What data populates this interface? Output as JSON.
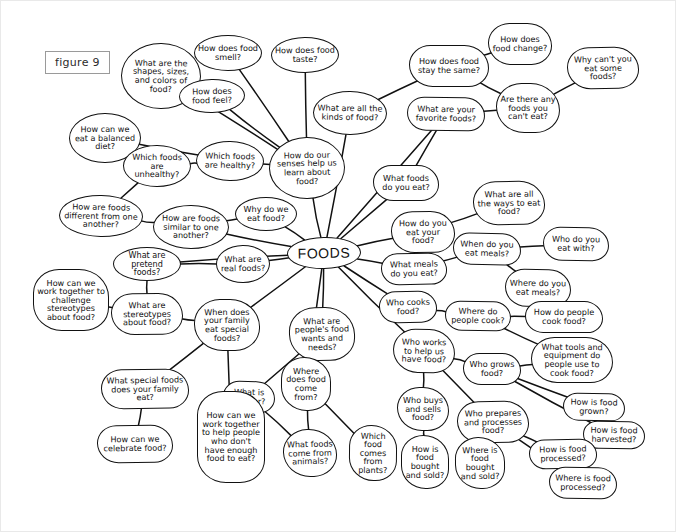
{
  "figure": {
    "label": "figure 9"
  },
  "diagram": {
    "center": {
      "id": "foods",
      "label": "FOODS",
      "x": 286,
      "y": 236,
      "w": 74,
      "h": 32
    },
    "ink_color": "#111111",
    "background_color": "#ffffff",
    "nodes": [
      {
        "id": "shapes_sizes_colors",
        "label": "What are the shapes, sizes, and colors of food?",
        "x": 120,
        "y": 42,
        "w": 80,
        "h": 66,
        "shape": "round"
      },
      {
        "id": "food_smell",
        "label": "How does food smell?",
        "x": 193,
        "y": 34,
        "w": 68,
        "h": 36,
        "shape": "round"
      },
      {
        "id": "food_taste",
        "label": "How does food taste?",
        "x": 270,
        "y": 36,
        "w": 68,
        "h": 36,
        "shape": "round"
      },
      {
        "id": "food_feel",
        "label": "How does food feel?",
        "x": 178,
        "y": 78,
        "w": 66,
        "h": 34,
        "shape": "round"
      },
      {
        "id": "kinds_of_food",
        "label": "What are all the kinds of food?",
        "x": 312,
        "y": 90,
        "w": 74,
        "h": 44,
        "shape": "round"
      },
      {
        "id": "food_stay_same",
        "label": "How does food stay the same?",
        "x": 408,
        "y": 44,
        "w": 80,
        "h": 42,
        "shape": "soft"
      },
      {
        "id": "food_change",
        "label": "How does food change?",
        "x": 487,
        "y": 22,
        "w": 64,
        "h": 42,
        "shape": "soft"
      },
      {
        "id": "why_cant_eat",
        "label": "Why can't you eat some foods?",
        "x": 566,
        "y": 46,
        "w": 72,
        "h": 42,
        "shape": "soft"
      },
      {
        "id": "favorite_foods",
        "label": "What are your favorite foods?",
        "x": 406,
        "y": 96,
        "w": 78,
        "h": 34,
        "shape": "soft"
      },
      {
        "id": "foods_cant_eat",
        "label": "Are there any foods you can't eat?",
        "x": 495,
        "y": 82,
        "w": 64,
        "h": 50,
        "shape": "soft"
      },
      {
        "id": "balanced_diet",
        "label": "How can we eat a balanced diet?",
        "x": 68,
        "y": 112,
        "w": 72,
        "h": 50,
        "shape": "round"
      },
      {
        "id": "senses_learn",
        "label": "How do our senses help us learn about food?",
        "x": 268,
        "y": 136,
        "w": 76,
        "h": 62,
        "shape": "round"
      },
      {
        "id": "which_healthy",
        "label": "Which foods are healthy?",
        "x": 195,
        "y": 140,
        "w": 68,
        "h": 40,
        "shape": "round"
      },
      {
        "id": "foods_unhealthy",
        "label": "Which foods are unhealthy?",
        "x": 122,
        "y": 144,
        "w": 68,
        "h": 42,
        "shape": "round"
      },
      {
        "id": "foods_you_eat",
        "label": "What foods do you eat?",
        "x": 372,
        "y": 164,
        "w": 66,
        "h": 36,
        "shape": "soft"
      },
      {
        "id": "ways_to_eat",
        "label": "What are all the ways to eat food?",
        "x": 472,
        "y": 180,
        "w": 72,
        "h": 44,
        "shape": "soft"
      },
      {
        "id": "foods_different",
        "label": "How are foods different from one another?",
        "x": 58,
        "y": 194,
        "w": 84,
        "h": 42,
        "shape": "round"
      },
      {
        "id": "foods_similar",
        "label": "How are foods similar to one another?",
        "x": 152,
        "y": 204,
        "w": 76,
        "h": 44,
        "shape": "round"
      },
      {
        "id": "why_eat_food",
        "label": "Why do we eat food?",
        "x": 234,
        "y": 196,
        "w": 62,
        "h": 34,
        "shape": "round"
      },
      {
        "id": "how_eat_food",
        "label": "How do you eat your food?",
        "x": 390,
        "y": 210,
        "w": 64,
        "h": 42,
        "shape": "soft"
      },
      {
        "id": "when_eat_meals",
        "label": "When do you eat meals?",
        "x": 452,
        "y": 232,
        "w": 68,
        "h": 32,
        "shape": "soft"
      },
      {
        "id": "who_eat_with",
        "label": "Who do you eat with?",
        "x": 542,
        "y": 226,
        "w": 66,
        "h": 34,
        "shape": "soft"
      },
      {
        "id": "pretend_foods",
        "label": "What are pretend foods?",
        "x": 112,
        "y": 246,
        "w": 68,
        "h": 34,
        "shape": "round"
      },
      {
        "id": "real_foods",
        "label": "What are real foods?",
        "x": 215,
        "y": 244,
        "w": 54,
        "h": 38,
        "shape": "round"
      },
      {
        "id": "what_meals",
        "label": "What meals do you eat?",
        "x": 380,
        "y": 252,
        "w": 66,
        "h": 32,
        "shape": "soft"
      },
      {
        "id": "where_eat_meals",
        "label": "Where do you eat meals?",
        "x": 504,
        "y": 268,
        "w": 66,
        "h": 38,
        "shape": "soft"
      },
      {
        "id": "challenge_stereo",
        "label": "How can we work together to challenge stereotypes about food?",
        "x": 32,
        "y": 268,
        "w": 76,
        "h": 62,
        "shape": "soft"
      },
      {
        "id": "stereotypes",
        "label": "What are stereotypes about food?",
        "x": 110,
        "y": 292,
        "w": 72,
        "h": 42,
        "shape": "soft"
      },
      {
        "id": "who_cooks",
        "label": "Who cooks food?",
        "x": 378,
        "y": 290,
        "w": 58,
        "h": 32,
        "shape": "soft"
      },
      {
        "id": "where_cook",
        "label": "Where do people cook?",
        "x": 444,
        "y": 300,
        "w": 66,
        "h": 30,
        "shape": "soft"
      },
      {
        "id": "how_people_cook",
        "label": "How do people cook food?",
        "x": 524,
        "y": 300,
        "w": 78,
        "h": 32,
        "shape": "soft"
      },
      {
        "id": "family_special",
        "label": "When does your family eat special foods?",
        "x": 193,
        "y": 298,
        "w": 66,
        "h": 52,
        "shape": "soft"
      },
      {
        "id": "peoples_wants",
        "label": "What are people's food wants and needs?",
        "x": 288,
        "y": 306,
        "w": 66,
        "h": 54,
        "shape": "soft"
      },
      {
        "id": "who_helps",
        "label": "Who works to help us have food?",
        "x": 392,
        "y": 328,
        "w": 62,
        "h": 44,
        "shape": "soft"
      },
      {
        "id": "tools_equipment",
        "label": "What tools and equipment do people use to cook food?",
        "x": 530,
        "y": 336,
        "w": 82,
        "h": 46,
        "shape": "soft"
      },
      {
        "id": "who_grows",
        "label": "Who grows food?",
        "x": 462,
        "y": 352,
        "w": 58,
        "h": 32,
        "shape": "soft"
      },
      {
        "id": "special_family",
        "label": "What special foods does your family eat?",
        "x": 100,
        "y": 368,
        "w": 88,
        "h": 40,
        "shape": "soft"
      },
      {
        "id": "what_is_hunger",
        "label": "What is hunger?",
        "x": 222,
        "y": 380,
        "w": 52,
        "h": 32,
        "shape": "soft"
      },
      {
        "id": "where_food_from",
        "label": "Where does food come from?",
        "x": 280,
        "y": 356,
        "w": 50,
        "h": 54,
        "shape": "soft"
      },
      {
        "id": "who_buys_sells",
        "label": "Who buys and sells food?",
        "x": 396,
        "y": 386,
        "w": 52,
        "h": 44,
        "shape": "soft"
      },
      {
        "id": "who_prepares",
        "label": "Who prepares and processes food?",
        "x": 456,
        "y": 400,
        "w": 72,
        "h": 42,
        "shape": "soft"
      },
      {
        "id": "how_grown",
        "label": "How is food grown?",
        "x": 562,
        "y": 392,
        "w": 62,
        "h": 28,
        "shape": "soft"
      },
      {
        "id": "how_harvested",
        "label": "How is food harvested?",
        "x": 582,
        "y": 420,
        "w": 62,
        "h": 28,
        "shape": "soft"
      },
      {
        "id": "help_people",
        "label": "How can we work together to help people who don't have enough food to eat?",
        "x": 196,
        "y": 390,
        "w": 68,
        "h": 92,
        "shape": "soft"
      },
      {
        "id": "celebrate",
        "label": "How can we celebrate food?",
        "x": 96,
        "y": 424,
        "w": 76,
        "h": 38,
        "shape": "soft"
      },
      {
        "id": "from_animals",
        "label": "What foods come from animals?",
        "x": 282,
        "y": 428,
        "w": 54,
        "h": 48,
        "shape": "soft"
      },
      {
        "id": "from_plants",
        "label": "Which food comes from plants?",
        "x": 348,
        "y": 424,
        "w": 48,
        "h": 56,
        "shape": "soft"
      },
      {
        "id": "bought_sold_how",
        "label": "How is food bought and sold?",
        "x": 400,
        "y": 434,
        "w": 48,
        "h": 54,
        "shape": "soft"
      },
      {
        "id": "bought_sold_where",
        "label": "Where is food bought and sold?",
        "x": 454,
        "y": 436,
        "w": 50,
        "h": 52,
        "shape": "soft"
      },
      {
        "id": "how_processed",
        "label": "How is food processed?",
        "x": 528,
        "y": 438,
        "w": 68,
        "h": 30,
        "shape": "soft"
      },
      {
        "id": "where_processed",
        "label": "Where is food processed?",
        "x": 548,
        "y": 466,
        "w": 68,
        "h": 32,
        "shape": "soft"
      }
    ],
    "edges": [
      [
        "foods",
        "senses_learn"
      ],
      [
        "foods",
        "why_eat_food"
      ],
      [
        "foods",
        "real_foods"
      ],
      [
        "foods",
        "foods_similar"
      ],
      [
        "foods",
        "kinds_of_food"
      ],
      [
        "foods",
        "favorite_foods"
      ],
      [
        "foods",
        "foods_you_eat"
      ],
      [
        "foods",
        "how_eat_food"
      ],
      [
        "foods",
        "what_meals"
      ],
      [
        "foods",
        "who_cooks"
      ],
      [
        "foods",
        "who_helps"
      ],
      [
        "foods",
        "peoples_wants"
      ],
      [
        "foods",
        "where_food_from"
      ],
      [
        "foods",
        "family_special"
      ],
      [
        "foods",
        "pretend_foods"
      ],
      [
        "senses_learn",
        "food_smell"
      ],
      [
        "senses_learn",
        "food_taste"
      ],
      [
        "senses_learn",
        "food_feel"
      ],
      [
        "senses_learn",
        "shapes_sizes_colors"
      ],
      [
        "senses_learn",
        "which_healthy"
      ],
      [
        "which_healthy",
        "balanced_diet"
      ],
      [
        "which_healthy",
        "foods_unhealthy"
      ],
      [
        "foods_unhealthy",
        "foods_different"
      ],
      [
        "why_eat_food",
        "foods_similar"
      ],
      [
        "foods_different",
        "foods_similar"
      ],
      [
        "kinds_of_food",
        "food_stay_same"
      ],
      [
        "food_stay_same",
        "food_change"
      ],
      [
        "food_stay_same",
        "foods_cant_eat"
      ],
      [
        "foods_cant_eat",
        "why_cant_eat"
      ],
      [
        "favorite_foods",
        "foods_cant_eat"
      ],
      [
        "favorite_foods",
        "foods_you_eat"
      ],
      [
        "how_eat_food",
        "ways_to_eat"
      ],
      [
        "when_eat_meals",
        "who_eat_with"
      ],
      [
        "what_meals",
        "when_eat_meals"
      ],
      [
        "when_eat_meals",
        "where_eat_meals"
      ],
      [
        "who_cooks",
        "where_cook"
      ],
      [
        "where_cook",
        "how_people_cook"
      ],
      [
        "where_cook",
        "tools_equipment"
      ],
      [
        "who_helps",
        "who_grows"
      ],
      [
        "who_grows",
        "tools_equipment"
      ],
      [
        "who_grows",
        "how_grown"
      ],
      [
        "who_grows",
        "how_harvested"
      ],
      [
        "who_helps",
        "who_buys_sells"
      ],
      [
        "who_helps",
        "who_prepares"
      ],
      [
        "who_buys_sells",
        "bought_sold_how"
      ],
      [
        "who_prepares",
        "bought_sold_where"
      ],
      [
        "who_prepares",
        "how_processed"
      ],
      [
        "who_prepares",
        "where_processed"
      ],
      [
        "peoples_wants",
        "what_is_hunger"
      ],
      [
        "what_is_hunger",
        "from_animals"
      ],
      [
        "where_food_from",
        "from_plants"
      ],
      [
        "where_food_from",
        "from_animals"
      ],
      [
        "pretend_foods",
        "real_foods"
      ],
      [
        "stereotypes",
        "challenge_stereo"
      ],
      [
        "stereotypes",
        "family_special"
      ],
      [
        "family_special",
        "special_family"
      ],
      [
        "special_family",
        "celebrate"
      ],
      [
        "family_special",
        "help_people"
      ],
      [
        "pretend_foods",
        "stereotypes"
      ]
    ]
  }
}
